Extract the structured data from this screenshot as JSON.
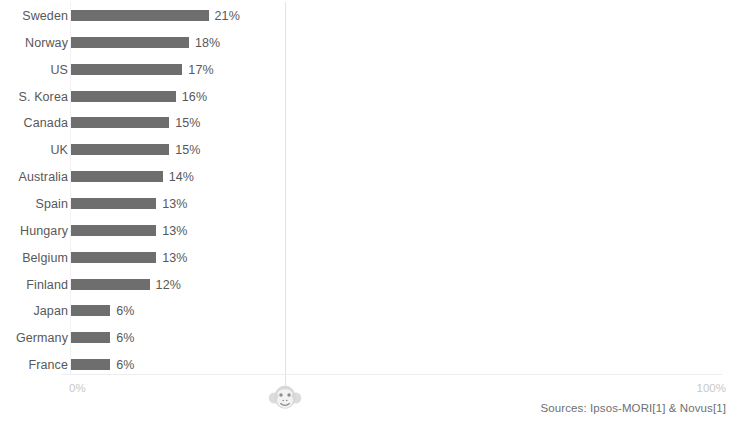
{
  "chart_data": {
    "type": "bar",
    "orientation": "horizontal",
    "title": "",
    "subtitle": "",
    "xlabel": "",
    "ylabel": "",
    "categories": [
      "Sweden",
      "Norway",
      "US",
      "S. Korea",
      "Canada",
      "UK",
      "Australia",
      "Spain",
      "Hungary",
      "Belgium",
      "Finland",
      "Japan",
      "Germany",
      "France"
    ],
    "values": [
      21,
      18,
      17,
      16,
      15,
      15,
      14,
      13,
      13,
      13,
      12,
      6,
      6,
      6
    ],
    "value_labels": [
      "21%",
      "18%",
      "17%",
      "16%",
      "15%",
      "15%",
      "14%",
      "13%",
      "13%",
      "13%",
      "12%",
      "6%",
      "6%",
      "6%"
    ],
    "xlim": [
      0,
      100
    ],
    "xtick_labels": [
      "0%",
      "100%"
    ],
    "grid": true,
    "gridlines": [
      "vertical midline at 50%",
      "horizontal baseline"
    ],
    "legend": null,
    "bar_color": "#6e6e6e",
    "label_color": "#58585a",
    "tick_color": "#c8c8ca",
    "background": "#ffffff"
  },
  "axis": {
    "left_tick": "0%",
    "right_tick": "100%"
  },
  "footer": {
    "sources": "Sources: Ipsos-MORI[1] & Novus[1]"
  },
  "watermark": {
    "icon": "monkey-face-icon",
    "color": "#dededf"
  }
}
